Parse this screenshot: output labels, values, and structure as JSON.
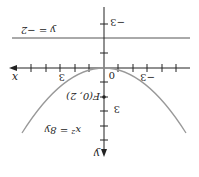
{
  "figure": {
    "rotation_deg": 180,
    "parabola_equation": "x² = 8y",
    "directrix_label": "y = −2",
    "focus_label": "F(0, 2)",
    "x_axis_label": "x",
    "y_axis_label": "y",
    "origin_label": "0",
    "tick_labels": {
      "x_pos3": "3",
      "x_neg3": "−3",
      "y_pos3": "3",
      "y_neg3": "−3"
    },
    "colors": {
      "axis": "#222222",
      "curve": "#999999",
      "directrix": "#555555"
    }
  }
}
